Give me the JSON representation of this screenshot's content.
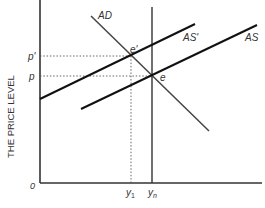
{
  "diagram": {
    "y_axis_label": "THE PRICE LEVEL",
    "origin_label": "0",
    "price_labels": {
      "p_prime": "p'",
      "p": "p"
    },
    "output_labels": {
      "y1_main": "y",
      "y1_sub": "1",
      "yn_main": "y",
      "yn_sub": "n"
    },
    "curve_labels": {
      "ad": "AD",
      "as_prime": "AS'",
      "as": "AS"
    },
    "point_labels": {
      "e_prime": "e'",
      "e": "e"
    },
    "colors": {
      "axis": "#333333",
      "curve": "#111111",
      "ad": "#444444",
      "guide": "#555555"
    }
  }
}
